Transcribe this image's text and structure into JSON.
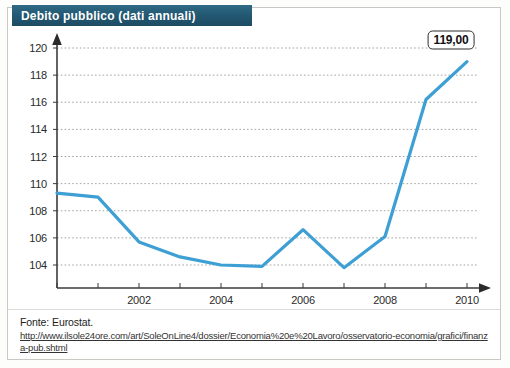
{
  "header": {
    "title": "Debito pubblico (dati annuali)",
    "banner_color": "#225670"
  },
  "callout": {
    "value_label": "119,00"
  },
  "footer": {
    "source_label": "Fonte: Eurostat.",
    "url": "http://www.ilsole24ore.com/art/SoleOnLine4/dossier/Economia%20e%20Lavoro/osservatorio-economia/grafici/finanza-pub.shtml"
  },
  "chart_data": {
    "type": "line",
    "title": "Debito pubblico (dati annuali)",
    "xlabel": "",
    "ylabel": "",
    "x": [
      2000,
      2001,
      2002,
      2003,
      2004,
      2005,
      2006,
      2007,
      2008,
      2009,
      2010
    ],
    "values": [
      109.3,
      109.0,
      105.7,
      104.6,
      104.0,
      103.9,
      106.6,
      103.8,
      106.1,
      116.2,
      119.0
    ],
    "series": [
      {
        "name": "Debito pubblico",
        "color": "#3d9fd4",
        "values": [
          109.3,
          109.0,
          105.7,
          104.6,
          104.0,
          103.9,
          106.6,
          103.8,
          106.1,
          116.2,
          119.0
        ]
      }
    ],
    "ylim": [
      103,
      120.8
    ],
    "xlim": [
      2000,
      2010
    ],
    "yticks": [
      104,
      106,
      108,
      110,
      112,
      114,
      116,
      118,
      120
    ],
    "ytick_labels": [
      "104",
      "106",
      "108",
      "110",
      "112",
      "114",
      "116",
      "118",
      "120"
    ],
    "xticks": [
      2002,
      2004,
      2006,
      2008,
      2010
    ],
    "xtick_labels": [
      "2002",
      "2004",
      "2006",
      "2008",
      "2010"
    ],
    "grid": true,
    "grid_style": "dotted-horizontal",
    "legend": false,
    "annotations": [
      {
        "x": 2010,
        "y": 119.0,
        "text": "119,00"
      }
    ]
  }
}
